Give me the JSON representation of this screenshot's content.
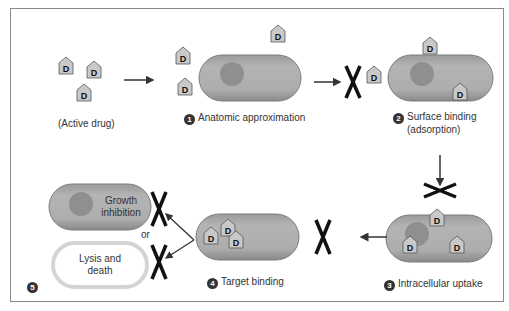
{
  "diagram": {
    "drug_symbol": "D",
    "colors": {
      "cell_fill": "#a9a9a9",
      "cell_edge": "#7d7d7d",
      "nucleoid": "#8f8f8f",
      "drug_fill": "#c9c9c9",
      "text": "#333333",
      "block_x": "#111111",
      "frame": "#8a8a8a"
    },
    "steps": [
      {
        "id": "0",
        "number": "",
        "label": "(Active drug)"
      },
      {
        "id": "1",
        "number": "1",
        "label": "Anatomic approximation"
      },
      {
        "id": "2",
        "number": "2",
        "label_line1": "Surface binding",
        "label_line2": "(adsorption)"
      },
      {
        "id": "3",
        "number": "3",
        "label": "Intracellular uptake"
      },
      {
        "id": "4",
        "number": "4",
        "label": "Target binding"
      },
      {
        "id": "5",
        "number": "5",
        "outcomes": [
          {
            "label_line1": "Growth",
            "label_line2": "inhibition"
          },
          {
            "label_line1": "Lysis and",
            "label_line2": "death"
          }
        ],
        "connector": "or"
      }
    ]
  }
}
